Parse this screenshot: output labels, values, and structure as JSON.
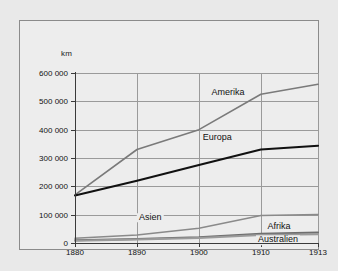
{
  "chart_data": {
    "type": "line",
    "title": "",
    "subtitle": "",
    "xlabel": "",
    "ylabel": "km",
    "unit_label": "km",
    "categories": [
      "1880",
      "1890",
      "1900",
      "1910",
      "1913"
    ],
    "x": [
      1880,
      1890,
      1900,
      1910,
      1913
    ],
    "x_positions_pct": [
      0,
      25.5,
      51.0,
      76.5,
      100
    ],
    "ylim": [
      0,
      600000
    ],
    "yticks": [
      0,
      100000,
      200000,
      300000,
      400000,
      500000,
      600000
    ],
    "ytick_labels": [
      "0",
      "100 000",
      "200 000",
      "300 000",
      "400 000",
      "500 000",
      "600 000"
    ],
    "xtick_labels": [
      "1880",
      "1890",
      "1900",
      "1910",
      "1913"
    ],
    "grid": true,
    "legend": "inline-labels",
    "series": [
      {
        "name": "Amerika",
        "color": "#7a7a7a",
        "width": 1.6,
        "values": [
          170000,
          330000,
          400000,
          525000,
          560000
        ],
        "label_x_pct": 63.0,
        "label_y_pct": 11.5
      },
      {
        "name": "Europa",
        "color": "#111111",
        "width": 2.1,
        "values": [
          168000,
          220000,
          275000,
          330000,
          343000
        ],
        "label_x_pct": 58.5,
        "label_y_pct": 38.5
      },
      {
        "name": "Asien",
        "color": "#8a8a8a",
        "width": 1.5,
        "values": [
          17000,
          28000,
          52000,
          97000,
          101000
        ],
        "label_x_pct": 31.0,
        "label_y_pct": 85.0
      },
      {
        "name": "Afrika",
        "color": "#6e6e6e",
        "width": 2.0,
        "values": [
          10000,
          14000,
          20000,
          33000,
          37000
        ],
        "label_x_pct": 84.0,
        "label_y_pct": 90.5
      },
      {
        "name": "Australien",
        "color": "#9b9b9b",
        "width": 2.0,
        "values": [
          8000,
          12000,
          18000,
          28000,
          31000
        ],
        "label_x_pct": 83.5,
        "label_y_pct": 98.5
      }
    ]
  },
  "colors": {
    "page_background": "#e9e9e9",
    "panel_background": "#ededed",
    "panel_border": "#8b8b8b",
    "axis": "#3a3a3a",
    "grid": "#9a9a9a",
    "text": "#111111"
  }
}
